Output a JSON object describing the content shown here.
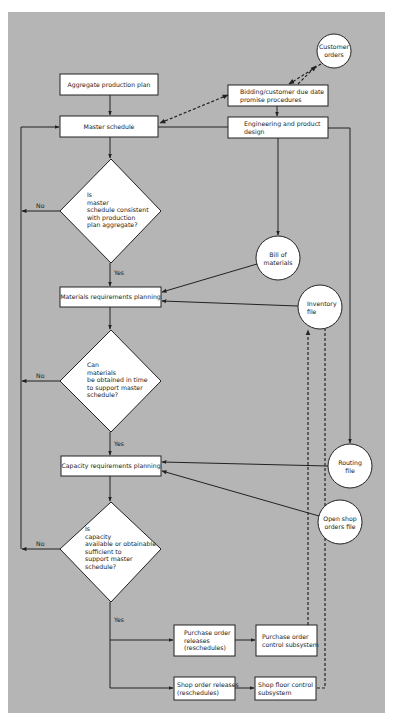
{
  "diagram": {
    "colors": {
      "background": "#b5b5b5",
      "node_fill": "#ffffff",
      "stroke": "#222222"
    },
    "nodes": {
      "aggregate_plan": "Aggregate production plan",
      "master_schedule": "Master schedule",
      "customer_orders": [
        "Customer",
        "orders"
      ],
      "bidding": [
        "Bidding/customer due date",
        "promise procedures"
      ],
      "engineering": [
        "Engineering and product",
        "design"
      ],
      "decision1": [
        "Is",
        "master",
        "schedule consistent",
        "with production",
        "plan aggregate?"
      ],
      "bill_of_materials": [
        "Bill of",
        "materials"
      ],
      "mrp": "Materials requirements planning",
      "inventory_file": [
        "Inventory",
        "file"
      ],
      "decision2": [
        "Can",
        "materials",
        "be obtained in time",
        "to support master",
        "schedule?"
      ],
      "routing_file": [
        "Routing",
        "file"
      ],
      "crp": "Capacity requirements planning",
      "open_shop_orders": [
        "Open shop",
        "orders file"
      ],
      "decision3": [
        "Is",
        "capacity",
        "available or obtainable",
        "sufficient to",
        "support master",
        "schedule?"
      ],
      "purchase_releases": [
        "Purchase order",
        "releases",
        "(reschedules)"
      ],
      "purchase_control": [
        "Purchase order",
        "control subsystem"
      ],
      "shop_releases": [
        "Shop order releases",
        "(reschedules)"
      ],
      "shop_floor_control": [
        "Shop floor control",
        "subsystem"
      ]
    },
    "edge_labels": {
      "no": "No",
      "yes": "Yes"
    }
  }
}
